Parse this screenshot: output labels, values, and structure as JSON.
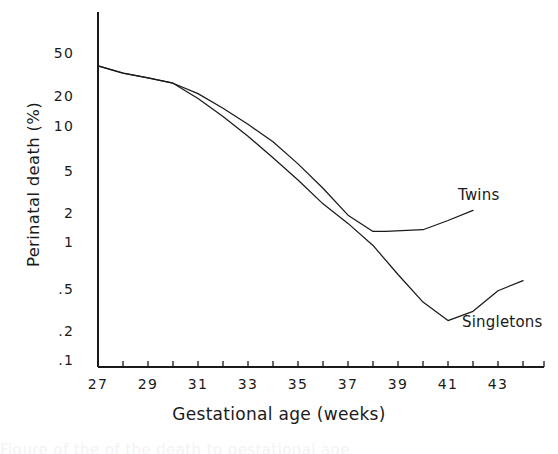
{
  "chart_data": {
    "type": "line",
    "title": "",
    "xlabel": "Gestational age (weeks)",
    "ylabel": "Perinatal death (%)",
    "y_scale": "log",
    "ylim": [
      0.1,
      60
    ],
    "xlim": [
      27,
      44.5
    ],
    "grid": false,
    "legend_position": "inline-annotations",
    "y_tick_labels": [
      "50",
      "20",
      "10",
      "5",
      "2",
      "1",
      ".5",
      ".2",
      ".1"
    ],
    "y_tick_values": [
      50,
      20,
      10,
      5,
      2,
      1,
      0.5,
      0.2,
      0.1
    ],
    "x_tick_labels": [
      "27",
      "29",
      "31",
      "33",
      "35",
      "37",
      "39",
      "41",
      "43"
    ],
    "x_tick_values": [
      27,
      29,
      31,
      33,
      35,
      37,
      39,
      41,
      43
    ],
    "x_minor_ticks": [
      27,
      28,
      29,
      30,
      31,
      32,
      33,
      34,
      35,
      36,
      37,
      38,
      39,
      40,
      41,
      42,
      43,
      44
    ],
    "series": [
      {
        "name": "Twins",
        "color": "#1a1a1a",
        "x": [
          27,
          28,
          29,
          30,
          31,
          32,
          33,
          34,
          35,
          36,
          37,
          38,
          38.5,
          40,
          41,
          42
        ],
        "values": [
          38,
          33,
          30,
          27,
          22,
          16.5,
          12,
          8.5,
          5.5,
          3.4,
          2.0,
          1.45,
          1.45,
          1.5,
          1.8,
          2.2
        ]
      },
      {
        "name": "Singletons",
        "color": "#1a1a1a",
        "x": [
          27,
          28,
          29,
          30,
          31,
          32,
          33,
          34,
          35,
          36,
          37,
          38,
          39,
          40,
          41,
          42,
          43,
          44
        ],
        "values": [
          38,
          33,
          30,
          27,
          20,
          14,
          9.5,
          6.2,
          4.0,
          2.5,
          1.7,
          1.1,
          0.62,
          0.36,
          0.25,
          0.3,
          0.45,
          0.55
        ]
      }
    ],
    "annotations": [
      {
        "text": "Twins",
        "series": "Twins"
      },
      {
        "text": "Singletons",
        "series": "Singletons"
      }
    ]
  },
  "axes": {
    "y_title": "Perinatal death (%)",
    "x_title": "Gestational age (weeks)",
    "y_ticks": [
      {
        "label": "50",
        "y": 45
      },
      {
        "label": "20",
        "y": 88
      },
      {
        "label": "10",
        "y": 118
      },
      {
        "label": "5",
        "y": 163
      },
      {
        "label": "2",
        "y": 205
      },
      {
        "label": "1",
        "y": 234
      },
      {
        "label": ".5",
        "y": 281
      },
      {
        "label": ".2",
        "y": 323
      },
      {
        "label": ".1",
        "y": 352
      }
    ],
    "x_ticks": [
      {
        "label": "27",
        "x": 78
      },
      {
        "label": "29",
        "x": 128
      },
      {
        "label": "31",
        "x": 178
      },
      {
        "label": "33",
        "x": 228
      },
      {
        "label": "35",
        "x": 278
      },
      {
        "label": "37",
        "x": 328
      },
      {
        "label": "39",
        "x": 378
      },
      {
        "label": "41",
        "x": 428
      },
      {
        "label": "43",
        "x": 478
      }
    ]
  },
  "labels": {
    "twins": "Twins",
    "singletons": "Singletons"
  },
  "caption": {
    "cut_off_line": "Figure  of the   of   the  death  to  gestational  age"
  }
}
